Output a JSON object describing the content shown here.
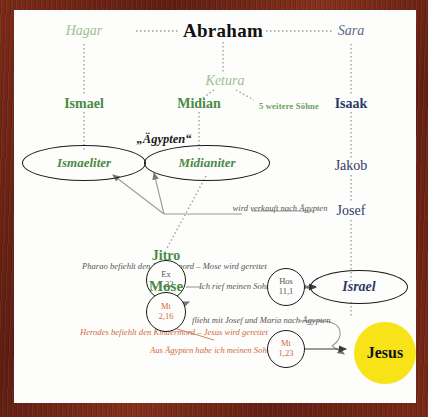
{
  "diagram": {
    "title": "Abraham",
    "people": {
      "abraham": "Abraham",
      "hagar": "Hagar",
      "ketura": "Ketura",
      "sara": "Sara",
      "ismael": "Ismael",
      "midian": "Midian",
      "isaak": "Isaak",
      "jakob": "Jakob",
      "josef": "Josef",
      "jitro": "Jitro",
      "mose": "Mose",
      "five_sons": "5 weitere Söhne"
    },
    "groups": {
      "ismaeliter": "Ismaeliter",
      "midianiter": "Midianiter",
      "israel": "Israel",
      "jesus": "Jesus"
    },
    "labels": {
      "egypt": "„Ägypten“",
      "sold_to_egypt": "wird verkauft nach Ägypten",
      "pharaoh_note": "Pharao befiehlt den Kindermord – Mose wird gerettet",
      "herod_note": "Herodes befiehlt den Kindermord – Jesus wird gerettet",
      "hosea_quote": "Ich rief meinen Sohn aus Ägypten",
      "flight_note": "flieht mit Josef und Maria nach Ägypten",
      "matthew_quote": "Aus Ägypten habe ich meinen Sohn gerufen"
    },
    "references": {
      "ex": {
        "book": "Ex",
        "verse": "1,22"
      },
      "mt_kindermord": {
        "book": "Mt",
        "verse": "2,16"
      },
      "hos": {
        "book": "Hos",
        "verse": "11,1"
      },
      "mt_egypt": {
        "book": "Mt",
        "verse": "1,23"
      }
    },
    "colors": {
      "frame": "#6b2316",
      "canvas": "#fdfdfb",
      "green": "#4a8a45",
      "pale_green": "#9dbf93",
      "navy": "#2f3a66",
      "orange": "#d2693f",
      "gray": "#555555",
      "yellow": "#f7e318"
    }
  }
}
